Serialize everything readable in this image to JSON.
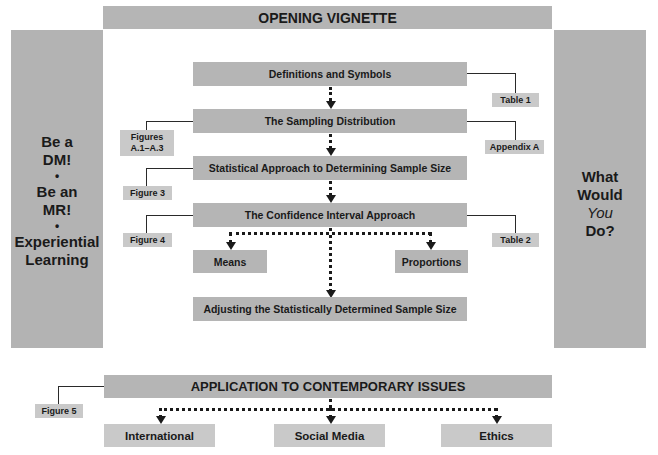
{
  "header": {
    "title": "OPENING VIGNETTE"
  },
  "left_panel": {
    "lines": [
      "Be a",
      "DM!",
      "•",
      "Be an",
      "MR!",
      "•",
      "Experiential",
      "Learning"
    ]
  },
  "right_panel": {
    "line1": "What",
    "line2": "Would",
    "line3_italic": "You",
    "line4": "Do?"
  },
  "flow": {
    "steps": [
      {
        "label": "Definitions and Symbols"
      },
      {
        "label": "The Sampling Distribution"
      },
      {
        "label": "Statistical Approach to Determining Sample Size"
      },
      {
        "label": "The Confidence Interval Approach"
      },
      {
        "label": "Adjusting the Statistically Determined Sample Size"
      }
    ],
    "branches": [
      {
        "label": "Means"
      },
      {
        "label": "Proportions"
      }
    ]
  },
  "references": {
    "table1": "Table 1",
    "figures_a": [
      "Figures",
      "A.1–A.3"
    ],
    "appendix_a": "Appendix A",
    "figure3": "Figure 3",
    "figure4": "Figure 4",
    "table2": "Table 2",
    "figure5": "Figure 5"
  },
  "footer": {
    "title": "APPLICATION TO CONTEMPORARY ISSUES",
    "issues": [
      {
        "label": "International"
      },
      {
        "label": "Social Media"
      },
      {
        "label": "Ethics"
      }
    ]
  }
}
